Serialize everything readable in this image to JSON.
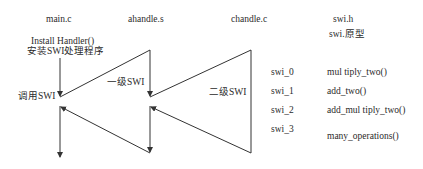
{
  "columns": {
    "main": "main.c",
    "ahandle": "ahandle.s",
    "chandle": "chandle.c",
    "swi_h": "swi.h",
    "swi_proto": "swi.原型"
  },
  "labels": {
    "install_handler": "Install Handler()",
    "install_handler_cn": "安装SWI处理程序",
    "call_swi": "调用SWI",
    "level1_swi": "一级SWI",
    "level2_swi": "二级SWI"
  },
  "swi_table": [
    {
      "id": "swi_0",
      "function": "mul tiply_two()"
    },
    {
      "id": "swi_1",
      "function": "add_two()"
    },
    {
      "id": "swi_2",
      "function": "add_mul tiply_two()"
    },
    {
      "id": "swi_3",
      "function": "many_operations()"
    }
  ],
  "colors": {
    "line": "#333333",
    "text": "#2a2a2a",
    "background": "#ffffff"
  }
}
